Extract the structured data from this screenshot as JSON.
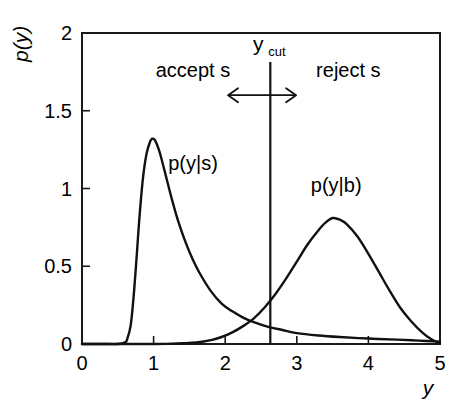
{
  "figure": {
    "axis_labels": {
      "y_axis": "p(y)",
      "x_axis": "y"
    },
    "x_tick_labels": [
      "0",
      "1",
      "2",
      "3",
      "4",
      "5"
    ],
    "y_tick_labels": [
      "0",
      "0.5",
      "1",
      "1.5",
      "2"
    ],
    "annotations": {
      "accept_region": "accept s",
      "reject_region": "reject s",
      "cut_main": "y",
      "cut_sub": "cut"
    },
    "curve_labels": {
      "signal": "p(y|s)",
      "background": "p(y|b)"
    },
    "colors": {
      "curve": "#111111",
      "axis": "#1a1a1a",
      "background": "#ffffff"
    }
  },
  "chart_data": {
    "type": "line",
    "title": "",
    "xlabel": "y",
    "ylabel": "p(y)",
    "xlim": [
      0,
      5
    ],
    "ylim": [
      0,
      2
    ],
    "xticks": [
      0,
      1,
      2,
      3,
      4,
      5
    ],
    "yticks": [
      0,
      0.5,
      1,
      1.5,
      2
    ],
    "grid": false,
    "legend": "none",
    "annotations": [
      {
        "text": "accept s",
        "x": 1.55,
        "y": 1.72
      },
      {
        "text": "reject s",
        "x": 3.72,
        "y": 1.72
      },
      {
        "text": "y_cut",
        "x": 2.63,
        "y": 1.92
      },
      {
        "text": "p(y|s)",
        "x": 1.55,
        "y": 1.12
      },
      {
        "text": "p(y|b)",
        "x": 3.55,
        "y": 0.98
      }
    ],
    "vertical_line": {
      "label": "y_cut",
      "x": 2.63
    },
    "double_arrow": {
      "x_start": 2.04,
      "x_end": 2.99,
      "y": 1.6
    },
    "series": [
      {
        "name": "p(y|s)",
        "label": "signal",
        "peak_x": 0.98,
        "peak_y": 1.32,
        "x": [
          0.0,
          0.3,
          0.5,
          0.6,
          0.63,
          0.68,
          0.72,
          0.76,
          0.8,
          0.85,
          0.9,
          0.95,
          0.98,
          1.02,
          1.08,
          1.15,
          1.25,
          1.35,
          1.45,
          1.55,
          1.65,
          1.8,
          1.95,
          2.1,
          2.25,
          2.4,
          2.6,
          2.8,
          3.0,
          3.3,
          3.6,
          4.0,
          4.4,
          4.7,
          5.0
        ],
        "y": [
          0.0,
          0.0,
          0.0,
          0.01,
          0.03,
          0.12,
          0.3,
          0.54,
          0.8,
          1.06,
          1.22,
          1.3,
          1.32,
          1.31,
          1.24,
          1.12,
          0.94,
          0.78,
          0.65,
          0.54,
          0.45,
          0.34,
          0.26,
          0.21,
          0.17,
          0.14,
          0.11,
          0.09,
          0.07,
          0.055,
          0.045,
          0.035,
          0.028,
          0.022,
          0.015
        ]
      },
      {
        "name": "p(y|b)",
        "label": "background",
        "peak_x": 3.5,
        "peak_y": 0.81,
        "x": [
          0.0,
          1.0,
          1.4,
          1.6,
          1.8,
          1.95,
          2.1,
          2.25,
          2.4,
          2.55,
          2.7,
          2.85,
          3.0,
          3.15,
          3.3,
          3.4,
          3.5,
          3.6,
          3.7,
          3.85,
          4.0,
          4.15,
          4.3,
          4.45,
          4.6,
          4.75,
          4.88,
          5.0
        ],
        "y": [
          0.0,
          0.0,
          0.005,
          0.01,
          0.025,
          0.045,
          0.075,
          0.115,
          0.165,
          0.235,
          0.32,
          0.42,
          0.53,
          0.64,
          0.73,
          0.78,
          0.81,
          0.8,
          0.77,
          0.69,
          0.58,
          0.46,
          0.34,
          0.23,
          0.145,
          0.075,
          0.03,
          0.005
        ]
      }
    ],
    "crossing_point": {
      "x": 2.4,
      "y": 0.17
    }
  }
}
